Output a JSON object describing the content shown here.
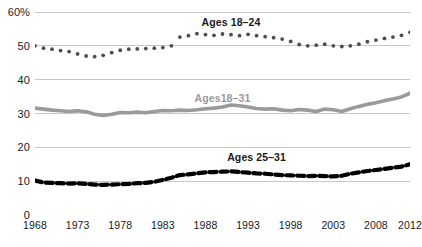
{
  "chart_data": {
    "type": "line",
    "title": "",
    "subtitle": "",
    "xlabel": "",
    "ylabel": "",
    "xlim": [
      1968,
      2012
    ],
    "ylim": [
      0,
      60
    ],
    "grid": true,
    "legend_position": "inline-annotations",
    "y_ticks": [
      "60%",
      "50",
      "40",
      "30",
      "20",
      "10",
      "0"
    ],
    "y_tick_values": [
      60,
      50,
      40,
      30,
      20,
      10,
      0
    ],
    "x_ticks": [
      "1968",
      "1973",
      "1978",
      "1983",
      "1988",
      "1993",
      "1998",
      "2003",
      "2008",
      "2012"
    ],
    "x_tick_values": [
      1968,
      1973,
      1978,
      1983,
      1988,
      1993,
      1998,
      2003,
      2008,
      2012
    ],
    "x": [
      1968,
      1969,
      1970,
      1971,
      1972,
      1973,
      1974,
      1975,
      1976,
      1977,
      1978,
      1979,
      1980,
      1981,
      1982,
      1983,
      1984,
      1985,
      1986,
      1987,
      1988,
      1989,
      1990,
      1991,
      1992,
      1993,
      1994,
      1995,
      1996,
      1997,
      1998,
      1999,
      2000,
      2001,
      2002,
      2003,
      2004,
      2005,
      2006,
      2007,
      2008,
      2009,
      2010,
      2011,
      2012
    ],
    "series": [
      {
        "name": "Ages 18-24",
        "label": "Ages 18–24",
        "style": "dotted",
        "color": "#4d4d4d",
        "values": [
          50.0,
          49.3,
          49.0,
          48.6,
          48.3,
          47.6,
          47.0,
          46.8,
          47.2,
          48.0,
          48.7,
          49.0,
          49.1,
          49.2,
          49.3,
          49.5,
          50.0,
          52.6,
          53.0,
          53.6,
          53.3,
          53.1,
          53.5,
          53.3,
          53.0,
          53.4,
          53.0,
          52.7,
          52.4,
          52.0,
          51.3,
          50.4,
          50.0,
          50.2,
          50.5,
          50.0,
          49.8,
          50.0,
          50.5,
          51.2,
          51.7,
          52.2,
          52.6,
          53.1,
          54.0
        ]
      },
      {
        "name": "Ages 18-31",
        "label": "Ages18–31",
        "style": "solid",
        "color": "#9a9a9a",
        "values": [
          31.6,
          31.3,
          31.0,
          30.8,
          30.6,
          30.8,
          30.5,
          29.8,
          29.4,
          29.8,
          30.3,
          30.2,
          30.4,
          30.2,
          30.6,
          30.9,
          30.8,
          31.0,
          30.9,
          31.1,
          31.4,
          31.6,
          31.9,
          32.5,
          32.3,
          31.9,
          31.5,
          31.3,
          31.4,
          31.0,
          30.8,
          31.2,
          31.0,
          30.6,
          31.3,
          31.1,
          30.6,
          31.4,
          32.1,
          32.7,
          33.2,
          33.8,
          34.3,
          34.9,
          36.0
        ]
      },
      {
        "name": "Ages 25-31",
        "label": "Ages 25–31",
        "style": "dashed",
        "color": "#000000",
        "values": [
          10.2,
          9.6,
          9.5,
          9.4,
          9.3,
          9.4,
          9.2,
          9.0,
          8.9,
          9.0,
          9.1,
          9.2,
          9.4,
          9.5,
          9.8,
          10.4,
          11.0,
          11.8,
          12.0,
          12.3,
          12.6,
          12.7,
          12.8,
          12.9,
          12.7,
          12.5,
          12.3,
          12.2,
          12.0,
          11.8,
          11.7,
          11.6,
          11.5,
          11.6,
          11.5,
          11.4,
          11.6,
          12.2,
          12.6,
          13.0,
          13.3,
          13.6,
          14.0,
          14.3,
          15.0
        ]
      }
    ],
    "annotations": [
      {
        "text": "Ages 18–24",
        "x": 1991,
        "y": 57.0,
        "color": "#1a1a1a"
      },
      {
        "text": "Ages18–31",
        "x": 1990,
        "y": 34.5,
        "color": "#9a9a9a"
      },
      {
        "text": "Ages 25–31",
        "x": 1994,
        "y": 17.0,
        "color": "#1a1a1a"
      }
    ]
  }
}
